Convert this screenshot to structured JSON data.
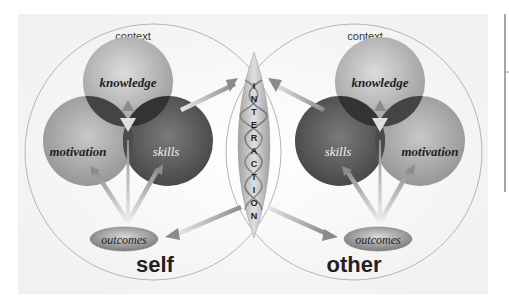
{
  "diagram": {
    "left": {
      "context_label": "context",
      "knowledge_label": "knowledge",
      "motivation_label": "motivation",
      "skills_label": "skills",
      "outcomes_label": "outcomes",
      "title": "self"
    },
    "right": {
      "context_label": "context",
      "knowledge_label": "knowledge",
      "skills_label": "skills",
      "motivation_label": "motivation",
      "outcomes_label": "outcomes",
      "title": "other"
    },
    "interaction": {
      "letters": [
        "I",
        "N",
        "T",
        "E",
        "R",
        "A",
        "C",
        "T",
        "I",
        "O",
        "N"
      ]
    }
  },
  "colors": {
    "knowledge": "#a8a8a8",
    "motivation": "#9a9a9a",
    "skills": "#5a5a5a",
    "overlap": "#3e3e3e",
    "context_stroke": "#b8b8b8",
    "arrow": "#8c8c8c",
    "outcomes": "#8a8a8a",
    "text_dark": "#222222"
  }
}
